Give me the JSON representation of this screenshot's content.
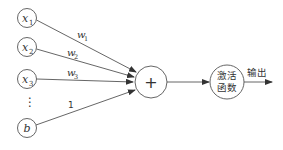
{
  "diagram": {
    "type": "neuron-model",
    "inputs": [
      {
        "id": "x1",
        "label": "x",
        "sub": "1",
        "weight": "w",
        "weight_sub": "1"
      },
      {
        "id": "x2",
        "label": "x",
        "sub": "2",
        "weight": "w",
        "weight_sub": "2"
      },
      {
        "id": "x3",
        "label": "x",
        "sub": "3",
        "weight": "w",
        "weight_sub": "3"
      },
      {
        "id": "b",
        "label": "b",
        "sub": "",
        "weight": "1",
        "weight_sub": ""
      }
    ],
    "ellipsis": "⋮",
    "sum_node": {
      "label": "+"
    },
    "activation_node": {
      "line1": "激活",
      "line2": "函数"
    },
    "output_label": "输出",
    "colors": {
      "stroke": "#555555",
      "text": "#333333",
      "background": "#ffffff"
    }
  }
}
